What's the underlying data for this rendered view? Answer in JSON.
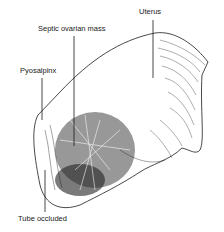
{
  "figure": {
    "labels": [
      {
        "id": "uterus",
        "text": "Uterus"
      },
      {
        "id": "septic-ovarian-mass",
        "text": "Septic ovarian mass"
      },
      {
        "id": "pyosalpinx",
        "text": "Pyosalpinx"
      },
      {
        "id": "tube-occluded",
        "text": "Tube occluded"
      }
    ],
    "colors": {
      "ink": "#1a1a1a",
      "background": "#ffffff"
    }
  }
}
